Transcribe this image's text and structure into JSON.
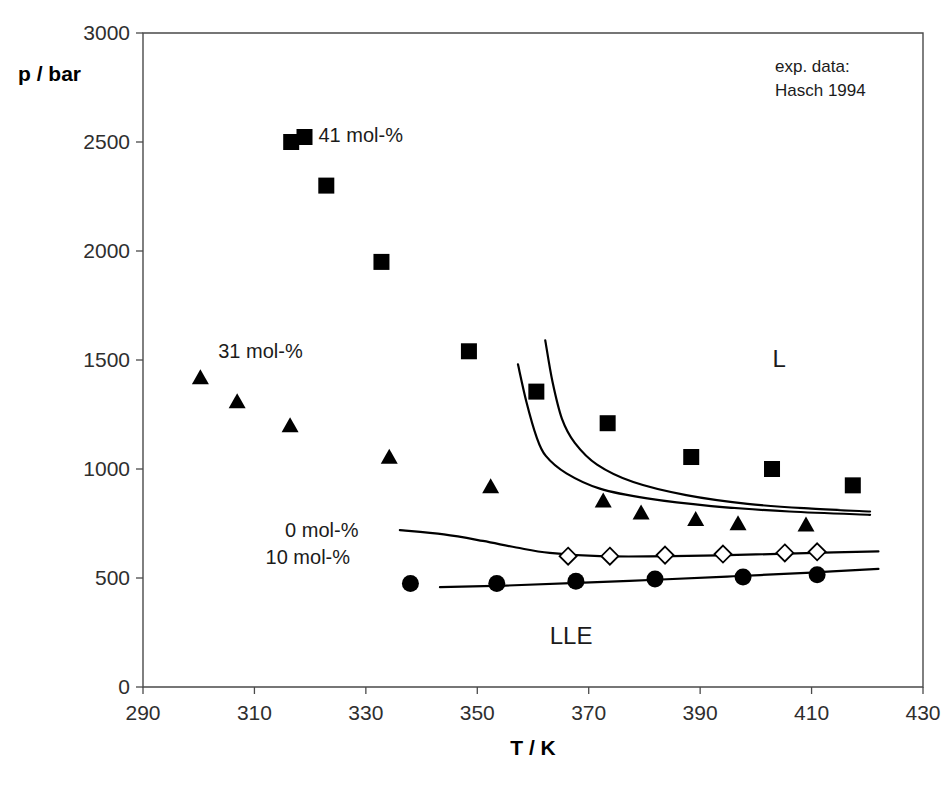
{
  "chart_data": {
    "type": "scatter",
    "title": "",
    "xlabel": "T / K",
    "ylabel": "p / bar",
    "xlim": [
      290,
      430
    ],
    "ylim": [
      0,
      3000
    ],
    "xticks": [
      290,
      310,
      330,
      350,
      370,
      390,
      410,
      430
    ],
    "yticks": [
      0,
      500,
      1000,
      1500,
      2000,
      2500,
      3000
    ],
    "grid": false,
    "legend_position": "inline-annotations",
    "source_note_line1": "exp. data:",
    "source_note_line2": "Hasch 1994",
    "region_label_vapor": "L",
    "region_label_liquid": "LLE",
    "series": [
      {
        "name": "41 mol-%",
        "marker": "filled-square",
        "label": "41 mol-%",
        "points": [
          {
            "x": 316.6,
            "y": 2500
          },
          {
            "x": 322.9,
            "y": 2300
          },
          {
            "x": 332.8,
            "y": 1950
          },
          {
            "x": 348.5,
            "y": 1540
          },
          {
            "x": 360.6,
            "y": 1355
          },
          {
            "x": 373.4,
            "y": 1210
          },
          {
            "x": 388.4,
            "y": 1055
          },
          {
            "x": 402.9,
            "y": 1000
          },
          {
            "x": 417.4,
            "y": 925
          }
        ]
      },
      {
        "name": "31 mol-%",
        "marker": "filled-triangle",
        "label": "31 mol-%",
        "points": [
          {
            "x": 300.3,
            "y": 1415
          },
          {
            "x": 306.9,
            "y": 1305
          },
          {
            "x": 316.4,
            "y": 1195
          },
          {
            "x": 334.2,
            "y": 1050
          },
          {
            "x": 352.4,
            "y": 915
          },
          {
            "x": 372.6,
            "y": 850
          },
          {
            "x": 379.4,
            "y": 795
          },
          {
            "x": 389.2,
            "y": 765
          },
          {
            "x": 396.8,
            "y": 745
          },
          {
            "x": 409.0,
            "y": 740
          }
        ]
      },
      {
        "name": "0 mol-%",
        "marker": "open-diamond",
        "label": "0 mol-%",
        "points": [
          {
            "x": 366.3,
            "y": 600
          },
          {
            "x": 373.8,
            "y": 600
          },
          {
            "x": 383.7,
            "y": 605
          },
          {
            "x": 394.1,
            "y": 610
          },
          {
            "x": 405.2,
            "y": 615
          },
          {
            "x": 411.0,
            "y": 620
          }
        ]
      },
      {
        "name": "10 mol-%",
        "marker": "filled-circle",
        "label": "10 mol-%",
        "points": [
          {
            "x": 338.0,
            "y": 475
          },
          {
            "x": 353.5,
            "y": 475
          },
          {
            "x": 367.7,
            "y": 485
          },
          {
            "x": 381.9,
            "y": 495
          },
          {
            "x": 397.7,
            "y": 505
          },
          {
            "x": 411.0,
            "y": 515
          }
        ]
      }
    ],
    "curves": [
      {
        "name": "41 mol-% model curve",
        "path": [
          {
            "x": 357.3,
            "y": 1480
          },
          {
            "x": 358.8,
            "y": 1310
          },
          {
            "x": 360.6,
            "y": 1150
          },
          {
            "x": 362.3,
            "y": 1060
          },
          {
            "x": 366.0,
            "y": 980
          },
          {
            "x": 372.0,
            "y": 910
          },
          {
            "x": 380.5,
            "y": 865
          },
          {
            "x": 392.0,
            "y": 830
          },
          {
            "x": 406.0,
            "y": 805
          },
          {
            "x": 420.5,
            "y": 790
          }
        ]
      },
      {
        "name": "31 mol-% model curve",
        "path": [
          {
            "x": 362.2,
            "y": 1590
          },
          {
            "x": 363.5,
            "y": 1400
          },
          {
            "x": 365.2,
            "y": 1230
          },
          {
            "x": 367.5,
            "y": 1120
          },
          {
            "x": 371.5,
            "y": 1020
          },
          {
            "x": 378.0,
            "y": 940
          },
          {
            "x": 387.5,
            "y": 880
          },
          {
            "x": 398.5,
            "y": 840
          },
          {
            "x": 410.0,
            "y": 818
          },
          {
            "x": 420.5,
            "y": 805
          }
        ]
      },
      {
        "name": "0 mol-% model curve",
        "path": [
          {
            "x": 336.1,
            "y": 720
          },
          {
            "x": 344.0,
            "y": 700
          },
          {
            "x": 351.0,
            "y": 670
          },
          {
            "x": 357.0,
            "y": 640
          },
          {
            "x": 363.0,
            "y": 615
          },
          {
            "x": 372.0,
            "y": 600
          },
          {
            "x": 385.0,
            "y": 600
          },
          {
            "x": 400.0,
            "y": 608
          },
          {
            "x": 414.0,
            "y": 618
          },
          {
            "x": 422.0,
            "y": 622
          }
        ]
      },
      {
        "name": "10 mol-% model curve",
        "path": [
          {
            "x": 343.3,
            "y": 458
          },
          {
            "x": 355.0,
            "y": 465
          },
          {
            "x": 368.0,
            "y": 478
          },
          {
            "x": 382.0,
            "y": 492
          },
          {
            "x": 396.0,
            "y": 508
          },
          {
            "x": 410.0,
            "y": 525
          },
          {
            "x": 422.0,
            "y": 542
          }
        ]
      }
    ],
    "annotations": [
      {
        "id": "label-41",
        "text": "41 mol-%",
        "x": 321.5,
        "y": 2500,
        "marker": "filled-square"
      },
      {
        "id": "label-31",
        "text": "31 mol-%",
        "x": 303.5,
        "y": 1510,
        "marker": "none"
      },
      {
        "id": "label-0",
        "text": "0 mol-%",
        "x": 315.5,
        "y": 690,
        "marker": "none"
      },
      {
        "id": "label-10",
        "text": "10 mol-%",
        "x": 312.0,
        "y": 565,
        "marker": "none"
      },
      {
        "id": "label-L",
        "text": "L",
        "x": 403.0,
        "y": 1470,
        "marker": "none"
      },
      {
        "id": "label-LLE",
        "text": "LLE",
        "x": 363.0,
        "y": 195,
        "marker": "none"
      }
    ]
  }
}
